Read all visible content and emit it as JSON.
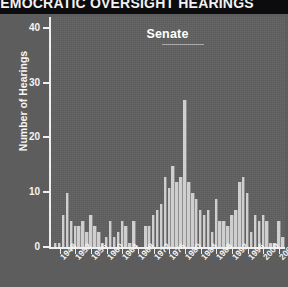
{
  "figure": {
    "title": "DEMOCRATIC OVERSIGHT HEARINGS",
    "title_visible_text": "RATIC OVERSIGHT HEARINGS",
    "panel_label": "Senate",
    "background_color": "#5d5d5d",
    "plot_background_color": "#606060",
    "bar_color": "#cfcfcf",
    "axis_color": "#efefef",
    "title_bar_color": "#0c0c0f",
    "title_text_color": "#f2f2f2"
  },
  "chart_data": {
    "type": "bar",
    "title": "DEMOCRATIC OVERSIGHT HEARINGS",
    "subtitle": "Senate",
    "xlabel": "",
    "ylabel": "Number of Hearings",
    "ylim": [
      0,
      42
    ],
    "yticks": [
      0,
      10,
      20,
      30,
      40
    ],
    "ytick_labels": [
      "0",
      "10",
      "20",
      "30",
      "40"
    ],
    "xlim": [
      1946,
      2006
    ],
    "xticks": [
      1948,
      1952,
      1956,
      1960,
      1964,
      1968,
      1972,
      1976,
      1980,
      1984,
      1988,
      1992,
      1996,
      2000,
      2004
    ],
    "xtick_labels": [
      "1948",
      "1952",
      "1956",
      "1960",
      "1964",
      "1968",
      "1972",
      "1976",
      "1980",
      "1984",
      "1988",
      "1992",
      "1996",
      "2000",
      "2004"
    ],
    "grid": false,
    "legend": false,
    "categories": [
      1947,
      1948,
      1949,
      1950,
      1951,
      1952,
      1953,
      1954,
      1955,
      1956,
      1957,
      1958,
      1959,
      1960,
      1961,
      1962,
      1963,
      1964,
      1965,
      1966,
      1967,
      1968,
      1969,
      1970,
      1971,
      1972,
      1973,
      1974,
      1975,
      1976,
      1977,
      1978,
      1979,
      1980,
      1981,
      1982,
      1983,
      1984,
      1985,
      1986,
      1987,
      1988,
      1989,
      1990,
      1991,
      1992,
      1993,
      1994,
      1995,
      1996,
      1997,
      1998,
      1999,
      2000,
      2001,
      2002,
      2003,
      2004,
      2005
    ],
    "values": [
      1,
      1,
      6,
      10,
      5,
      4,
      4,
      5,
      3,
      6,
      4,
      3,
      1,
      2,
      5,
      2,
      3,
      5,
      4,
      1,
      5,
      0,
      0,
      4,
      4,
      6,
      7,
      8,
      13,
      11,
      15,
      12,
      13,
      27,
      12,
      10,
      9,
      7,
      6,
      7,
      3,
      9,
      5,
      5,
      4,
      6,
      7,
      12,
      13,
      10,
      3,
      6,
      5,
      6,
      5,
      1,
      1,
      5,
      2
    ]
  }
}
